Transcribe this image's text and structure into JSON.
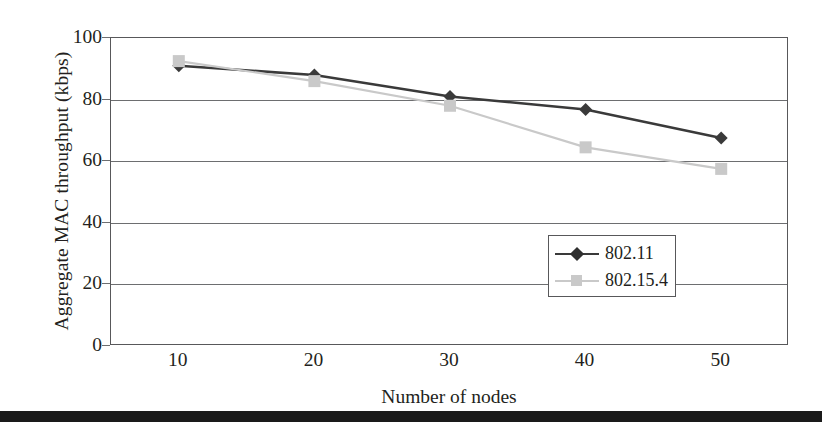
{
  "chart_data": {
    "type": "line",
    "title": "",
    "xlabel": "Number of nodes",
    "ylabel": "Aggregate MAC throughput (kbps)",
    "x": [
      10,
      20,
      30,
      40,
      50
    ],
    "xtick_labels": [
      "10",
      "20",
      "30",
      "40",
      "50"
    ],
    "ytick_labels": [
      "0",
      "20",
      "40",
      "60",
      "80",
      "100"
    ],
    "yticks": [
      0,
      20,
      40,
      60,
      80,
      100
    ],
    "ylim": [
      0,
      100
    ],
    "xlim": [
      5,
      55
    ],
    "grid": "horizontal",
    "legend_position": "lower right",
    "series": [
      {
        "name": "802.11",
        "values": [
          91,
          88,
          81,
          76.8,
          67.5
        ],
        "color": "#3a3a3a",
        "marker": "diamond"
      },
      {
        "name": "802.15.4",
        "values": [
          92.5,
          86,
          78,
          64.5,
          57.5
        ],
        "color": "#c9c9c9",
        "marker": "square"
      }
    ]
  },
  "axes": {
    "y_title": "Aggregate MAC throughput (kbps)",
    "x_title": "Number of nodes",
    "y_ticks": [
      {
        "label": "100",
        "value": 100
      },
      {
        "label": "80",
        "value": 80
      },
      {
        "label": "60",
        "value": 60
      },
      {
        "label": "40",
        "value": 40
      },
      {
        "label": "20",
        "value": 20
      },
      {
        "label": "0",
        "value": 0
      }
    ],
    "x_ticks": [
      {
        "label": "10",
        "value": 10
      },
      {
        "label": "20",
        "value": 20
      },
      {
        "label": "30",
        "value": 30
      },
      {
        "label": "40",
        "value": 40
      },
      {
        "label": "50",
        "value": 50
      }
    ]
  },
  "legend": {
    "entries": [
      {
        "label": "802.11",
        "color": "#3a3a3a",
        "marker": "diamond"
      },
      {
        "label": "802.15.4",
        "color": "#c9c9c9",
        "marker": "square"
      }
    ]
  },
  "colors": {
    "series_1": "#3a3a3a",
    "series_2": "#c9c9c9",
    "axis": "#58585a",
    "grid": "#6d6e70",
    "text": "#231f20",
    "rule": "#1a1a1a"
  }
}
